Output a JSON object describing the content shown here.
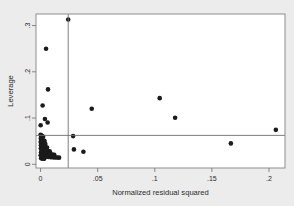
{
  "chart_data": {
    "type": "scatter",
    "title": "",
    "subtitle": "",
    "xlabel": "Normalized residual squared",
    "ylabel": "Leverage",
    "xlim": [
      -0.004,
      0.214
    ],
    "ylim": [
      -0.008,
      0.325
    ],
    "xticks": [
      0,
      0.05,
      0.1,
      0.15,
      0.2
    ],
    "xticklabels": [
      "0",
      ".05",
      ".1",
      ".15",
      ".2"
    ],
    "yticks": [
      0,
      0.1,
      0.2,
      0.3
    ],
    "yticklabels": [
      "0",
      ".1",
      ".2",
      ".3"
    ],
    "grid": false,
    "legend": "none",
    "marker": {
      "shape": "circle",
      "color": "#1b1b1b",
      "size": 4.6
    },
    "reference_lines": [
      {
        "orientation": "vertical",
        "value": 0.0242,
        "color": "#6f6f6f",
        "label": "mean normalized residual squared"
      },
      {
        "orientation": "horizontal",
        "value": 0.0625,
        "color": "#6f6f6f",
        "label": "mean leverage"
      }
    ],
    "series": [
      {
        "name": "observations",
        "points": [
          [
            0.0242,
            0.313
          ],
          [
            0.0048,
            0.25
          ],
          [
            0.0065,
            0.162
          ],
          [
            0.0018,
            0.127
          ],
          [
            0.0001,
            0.0845
          ],
          [
            0.0038,
            0.098
          ],
          [
            0.0062,
            0.0905
          ],
          [
            0.0448,
            0.12
          ],
          [
            0.1043,
            0.143
          ],
          [
            0.1178,
            0.1005
          ],
          [
            0.206,
            0.0745
          ],
          [
            0.1666,
            0.0452
          ],
          [
            0.0285,
            0.061
          ],
          [
            0.0292,
            0.0322
          ],
          [
            0.0375,
            0.0272
          ],
          [
            0.0,
            0.064
          ],
          [
            0.0004,
            0.0628
          ],
          [
            0.001,
            0.0618
          ],
          [
            0.0016,
            0.0605
          ],
          [
            0.0022,
            0.0596
          ],
          [
            0.0002,
            0.056
          ],
          [
            0.0006,
            0.0545
          ],
          [
            0.0013,
            0.053
          ],
          [
            0.0019,
            0.052
          ],
          [
            0.0028,
            0.0515
          ],
          [
            0.0035,
            0.0505
          ],
          [
            0.0001,
            0.048
          ],
          [
            0.0007,
            0.047
          ],
          [
            0.0012,
            0.0462
          ],
          [
            0.0021,
            0.0455
          ],
          [
            0.003,
            0.0448
          ],
          [
            0.0042,
            0.044
          ],
          [
            0.0003,
            0.041
          ],
          [
            0.0009,
            0.04
          ],
          [
            0.0015,
            0.0392
          ],
          [
            0.0024,
            0.0385
          ],
          [
            0.0033,
            0.0378
          ],
          [
            0.0045,
            0.037
          ],
          [
            0.0057,
            0.0362
          ],
          [
            0.0002,
            0.034
          ],
          [
            0.0008,
            0.033
          ],
          [
            0.0014,
            0.0322
          ],
          [
            0.002,
            0.0315
          ],
          [
            0.0029,
            0.0308
          ],
          [
            0.0039,
            0.03
          ],
          [
            0.0052,
            0.0295
          ],
          [
            0.0066,
            0.0288
          ],
          [
            0.008,
            0.0282
          ],
          [
            0.0004,
            0.0262
          ],
          [
            0.0011,
            0.0255
          ],
          [
            0.0018,
            0.0248
          ],
          [
            0.0026,
            0.0242
          ],
          [
            0.0036,
            0.0236
          ],
          [
            0.0048,
            0.023
          ],
          [
            0.0061,
            0.0224
          ],
          [
            0.0075,
            0.022
          ],
          [
            0.009,
            0.0216
          ],
          [
            0.0104,
            0.0212
          ],
          [
            0.012,
            0.0208
          ],
          [
            0.0001,
            0.0195
          ],
          [
            0.0007,
            0.0188
          ],
          [
            0.0016,
            0.0182
          ],
          [
            0.0025,
            0.0176
          ],
          [
            0.0034,
            0.0172
          ],
          [
            0.0044,
            0.0168
          ],
          [
            0.0056,
            0.0164
          ],
          [
            0.007,
            0.016
          ],
          [
            0.0086,
            0.0156
          ],
          [
            0.01,
            0.0152
          ],
          [
            0.0115,
            0.015
          ],
          [
            0.0131,
            0.0148
          ],
          [
            0.0146,
            0.0146
          ],
          [
            0.0162,
            0.0144
          ],
          [
            0.0005,
            0.013
          ],
          [
            0.0013,
            0.0126
          ],
          [
            0.0023,
            0.0122
          ],
          [
            0.0032,
            0.012
          ]
        ]
      }
    ]
  }
}
